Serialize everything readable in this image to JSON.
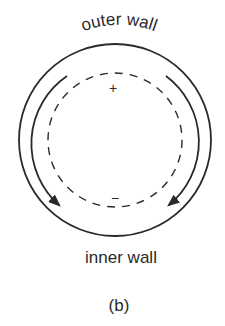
{
  "figure": {
    "caption": "(b)",
    "labels": {
      "outer_wall": "outer wall",
      "inner_wall": "inner wall"
    },
    "signs": {
      "top": "+",
      "bottom": "−"
    },
    "elements": [
      {
        "name": "outer-wall-circle",
        "type": "solid-circle"
      },
      {
        "name": "flow-arrow-left",
        "type": "arrow-arc",
        "direction": "counterclockwise-down-left"
      },
      {
        "name": "flow-arrow-right",
        "type": "arrow-arc",
        "direction": "clockwise-down-right"
      },
      {
        "name": "inner-dashed-circle",
        "type": "dashed-circle"
      }
    ],
    "colors": {
      "stroke": "#2a2a2a",
      "background": "#ffffff"
    }
  }
}
